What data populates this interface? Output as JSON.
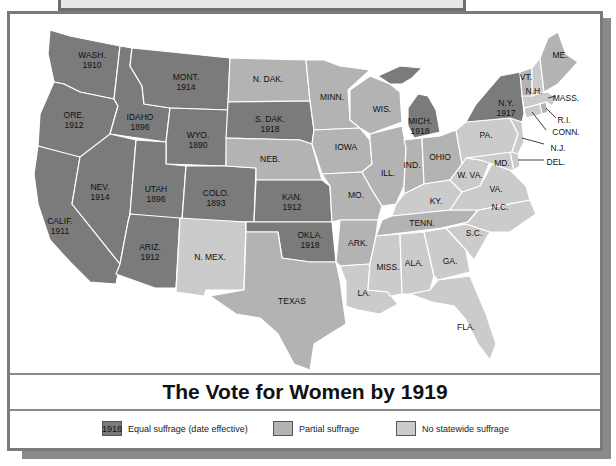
{
  "map": {
    "title": "The Vote for Women by 1919",
    "colors": {
      "equal": "#7b7b7b",
      "partial": "#b3b3b3",
      "none": "#cbcbcb",
      "border": "#ffffff",
      "water": "#ffffff"
    },
    "states": {
      "wa": {
        "name": "WASH.",
        "year": "1910",
        "category": "equal"
      },
      "or": {
        "name": "ORE.",
        "year": "1912",
        "category": "equal"
      },
      "ca": {
        "name": "CALIF.",
        "year": "1911",
        "category": "equal"
      },
      "id": {
        "name": "IDAHO",
        "year": "1896",
        "category": "equal"
      },
      "nv": {
        "name": "NEV.",
        "year": "1914",
        "category": "equal"
      },
      "mt": {
        "name": "MONT.",
        "year": "1914",
        "category": "equal"
      },
      "wy": {
        "name": "WYO.",
        "year": "1890",
        "category": "equal"
      },
      "ut": {
        "name": "UTAH",
        "year": "1896",
        "category": "equal"
      },
      "co": {
        "name": "COLO.",
        "year": "1893",
        "category": "equal"
      },
      "az": {
        "name": "ARIZ.",
        "year": "1912",
        "category": "equal"
      },
      "nm": {
        "name": "N. MEX.",
        "year": "",
        "category": "none"
      },
      "nd": {
        "name": "N. DAK.",
        "year": "",
        "category": "partial"
      },
      "sd": {
        "name": "S. DAK.",
        "year": "1918",
        "category": "equal"
      },
      "ne": {
        "name": "NEB.",
        "year": "",
        "category": "partial"
      },
      "ks": {
        "name": "KAN.",
        "year": "1912",
        "category": "equal"
      },
      "ok": {
        "name": "OKLA.",
        "year": "1918",
        "category": "equal"
      },
      "tx": {
        "name": "TEXAS",
        "year": "",
        "category": "partial"
      },
      "mn": {
        "name": "MINN.",
        "year": "",
        "category": "partial"
      },
      "ia": {
        "name": "IOWA",
        "year": "",
        "category": "partial"
      },
      "mo": {
        "name": "MO.",
        "year": "",
        "category": "partial"
      },
      "ar": {
        "name": "ARK.",
        "year": "",
        "category": "partial"
      },
      "la": {
        "name": "LA.",
        "year": "",
        "category": "none"
      },
      "wi": {
        "name": "WIS.",
        "year": "",
        "category": "partial"
      },
      "il": {
        "name": "ILL.",
        "year": "",
        "category": "partial"
      },
      "mi": {
        "name": "MICH.",
        "year": "1918",
        "category": "equal"
      },
      "in": {
        "name": "IND.",
        "year": "",
        "category": "partial"
      },
      "oh": {
        "name": "OHIO",
        "year": "",
        "category": "partial"
      },
      "ky": {
        "name": "KY.",
        "year": "",
        "category": "none"
      },
      "tn": {
        "name": "TENN.",
        "year": "",
        "category": "partial"
      },
      "ms": {
        "name": "MISS.",
        "year": "",
        "category": "none"
      },
      "al": {
        "name": "ALA.",
        "year": "",
        "category": "none"
      },
      "ga": {
        "name": "GA.",
        "year": "",
        "category": "none"
      },
      "fl": {
        "name": "FLA.",
        "year": "",
        "category": "none"
      },
      "sc": {
        "name": "S.C.",
        "year": "",
        "category": "none"
      },
      "nc": {
        "name": "N.C.",
        "year": "",
        "category": "none"
      },
      "va": {
        "name": "VA.",
        "year": "",
        "category": "none"
      },
      "wv": {
        "name": "W. VA.",
        "year": "",
        "category": "none"
      },
      "md": {
        "name": "MD.",
        "year": "",
        "category": "none"
      },
      "de": {
        "name": "DEL.",
        "year": "",
        "category": "none"
      },
      "pa": {
        "name": "PA.",
        "year": "",
        "category": "none"
      },
      "nj": {
        "name": "N.J.",
        "year": "",
        "category": "none"
      },
      "ny": {
        "name": "N.Y.",
        "year": "1917",
        "category": "equal"
      },
      "ct": {
        "name": "CONN.",
        "year": "",
        "category": "none"
      },
      "ri": {
        "name": "R.I.",
        "year": "",
        "category": "partial"
      },
      "ma": {
        "name": "MASS.",
        "year": "",
        "category": "none"
      },
      "vt": {
        "name": "VT.",
        "year": "",
        "category": "partial"
      },
      "nh": {
        "name": "N.H.",
        "year": "",
        "category": "none"
      },
      "me": {
        "name": "ME.",
        "year": "",
        "category": "partial"
      }
    }
  },
  "legend": {
    "equal": {
      "swatch_text": "1918",
      "label": "Equal suffrage (date effective)",
      "color": "#7b7b7b"
    },
    "partial": {
      "label": "Partial suffrage",
      "color": "#b3b3b3"
    },
    "none": {
      "label": "No statewide suffrage",
      "color": "#cbcbcb"
    }
  }
}
